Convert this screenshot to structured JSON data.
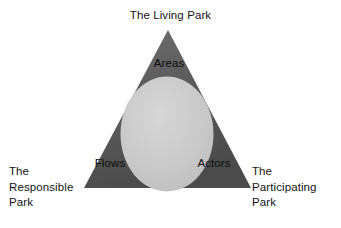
{
  "diagram": {
    "type": "venn-triangle-overlay",
    "background_color": "#ffffff",
    "triangle": {
      "fill_color": "#5a5a5a",
      "gradient_from": "#6e6e6e",
      "gradient_to": "#4a4a4a"
    },
    "circle": {
      "fill_color": "#c6c6c6",
      "gradient_from": "#d2d2d2",
      "gradient_to": "#bdbdbd"
    },
    "vertex_labels": {
      "top": "The Living Park",
      "left": "The\nResponsible\nPark",
      "right": "The\nParticipating\nPark"
    },
    "inner_labels": {
      "top": "Areas",
      "bottom_left": "Flows",
      "bottom_right": "Actors"
    }
  }
}
